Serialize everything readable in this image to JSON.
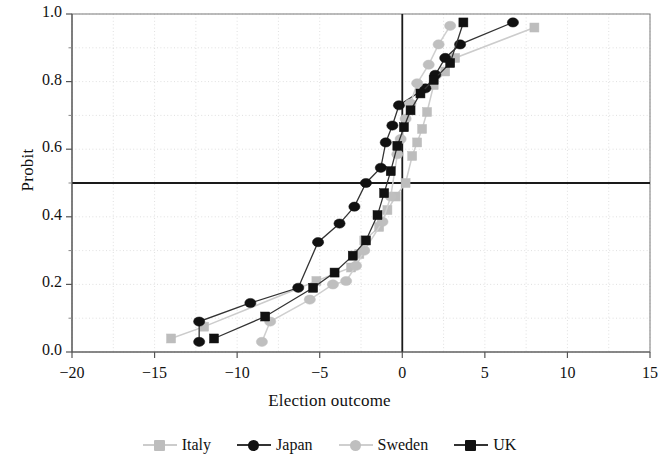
{
  "chart_data": {
    "type": "line",
    "title": "",
    "xlabel": "Election outcome",
    "ylabel": "Probit",
    "xlim": [
      -20,
      15
    ],
    "ylim": [
      0.0,
      1.0
    ],
    "xticks": [
      -20,
      -15,
      -10,
      -5,
      0,
      5,
      10,
      15
    ],
    "xtick_labels": [
      "−20",
      "−15",
      "−10",
      "−5",
      "0",
      "5",
      "10",
      "15"
    ],
    "yticks": [
      0.0,
      0.2,
      0.4,
      0.6,
      0.8,
      1.0
    ],
    "ytick_labels": [
      "0.0",
      "0.2",
      "0.4",
      "0.6",
      "0.8",
      "1.0"
    ],
    "grid": "dotted-minor",
    "reference_lines": [
      {
        "axis": "y",
        "value": 0.5,
        "style": "solid-black"
      },
      {
        "axis": "x",
        "value": 0,
        "style": "solid-black"
      }
    ],
    "legend_position": "bottom-center",
    "series": [
      {
        "name": "Italy",
        "marker": "square",
        "color": "#bdbdbd",
        "line_color": "#cccccc",
        "points": [
          {
            "x": -14.0,
            "y": 0.04
          },
          {
            "x": -12.0,
            "y": 0.075
          },
          {
            "x": -5.2,
            "y": 0.21
          },
          {
            "x": -3.1,
            "y": 0.25
          },
          {
            "x": -2.6,
            "y": 0.29
          },
          {
            "x": -2.3,
            "y": 0.33
          },
          {
            "x": -1.4,
            "y": 0.37
          },
          {
            "x": -0.9,
            "y": 0.42
          },
          {
            "x": -0.4,
            "y": 0.46
          },
          {
            "x": 0.2,
            "y": 0.5
          },
          {
            "x": 0.6,
            "y": 0.58
          },
          {
            "x": 0.9,
            "y": 0.62
          },
          {
            "x": 1.2,
            "y": 0.66
          },
          {
            "x": 1.5,
            "y": 0.71
          },
          {
            "x": 1.9,
            "y": 0.79
          },
          {
            "x": 2.6,
            "y": 0.83
          },
          {
            "x": 3.2,
            "y": 0.87
          },
          {
            "x": 8.0,
            "y": 0.96
          }
        ]
      },
      {
        "name": "Japan",
        "marker": "circle",
        "color": "#111111",
        "line_color": "#333333",
        "points": [
          {
            "x": -12.3,
            "y": 0.03
          },
          {
            "x": -12.3,
            "y": 0.09
          },
          {
            "x": -9.2,
            "y": 0.145
          },
          {
            "x": -6.3,
            "y": 0.19
          },
          {
            "x": -5.1,
            "y": 0.325
          },
          {
            "x": -3.8,
            "y": 0.38
          },
          {
            "x": -2.9,
            "y": 0.43
          },
          {
            "x": -2.2,
            "y": 0.5
          },
          {
            "x": -1.3,
            "y": 0.545
          },
          {
            "x": -1.0,
            "y": 0.62
          },
          {
            "x": -0.6,
            "y": 0.67
          },
          {
            "x": -0.2,
            "y": 0.73
          },
          {
            "x": 1.4,
            "y": 0.78
          },
          {
            "x": 2.0,
            "y": 0.82
          },
          {
            "x": 2.6,
            "y": 0.87
          },
          {
            "x": 3.5,
            "y": 0.91
          },
          {
            "x": 6.7,
            "y": 0.975
          }
        ]
      },
      {
        "name": "Sweden",
        "marker": "circle",
        "color": "#bfbfbf",
        "line_color": "#cfcfcf",
        "points": [
          {
            "x": -8.5,
            "y": 0.03
          },
          {
            "x": -8.0,
            "y": 0.09
          },
          {
            "x": -5.6,
            "y": 0.155
          },
          {
            "x": -4.2,
            "y": 0.2
          },
          {
            "x": -3.4,
            "y": 0.21
          },
          {
            "x": -2.8,
            "y": 0.255
          },
          {
            "x": -2.3,
            "y": 0.3
          },
          {
            "x": -1.2,
            "y": 0.385
          },
          {
            "x": -0.7,
            "y": 0.46
          },
          {
            "x": -0.3,
            "y": 0.585
          },
          {
            "x": -0.1,
            "y": 0.63
          },
          {
            "x": 0.2,
            "y": 0.69
          },
          {
            "x": 0.5,
            "y": 0.735
          },
          {
            "x": 0.9,
            "y": 0.795
          },
          {
            "x": 1.6,
            "y": 0.85
          },
          {
            "x": 2.2,
            "y": 0.91
          },
          {
            "x": 2.9,
            "y": 0.965
          }
        ]
      },
      {
        "name": "UK",
        "marker": "square",
        "color": "#111111",
        "line_color": "#333333",
        "points": [
          {
            "x": -11.4,
            "y": 0.04
          },
          {
            "x": -8.3,
            "y": 0.105
          },
          {
            "x": -5.4,
            "y": 0.19
          },
          {
            "x": -4.1,
            "y": 0.235
          },
          {
            "x": -3.0,
            "y": 0.285
          },
          {
            "x": -2.2,
            "y": 0.33
          },
          {
            "x": -1.5,
            "y": 0.405
          },
          {
            "x": -1.1,
            "y": 0.47
          },
          {
            "x": -0.7,
            "y": 0.535
          },
          {
            "x": -0.3,
            "y": 0.61
          },
          {
            "x": 0.1,
            "y": 0.665
          },
          {
            "x": 0.5,
            "y": 0.715
          },
          {
            "x": 1.1,
            "y": 0.765
          },
          {
            "x": 1.9,
            "y": 0.805
          },
          {
            "x": 2.9,
            "y": 0.855
          },
          {
            "x": 3.7,
            "y": 0.975
          }
        ]
      }
    ]
  }
}
